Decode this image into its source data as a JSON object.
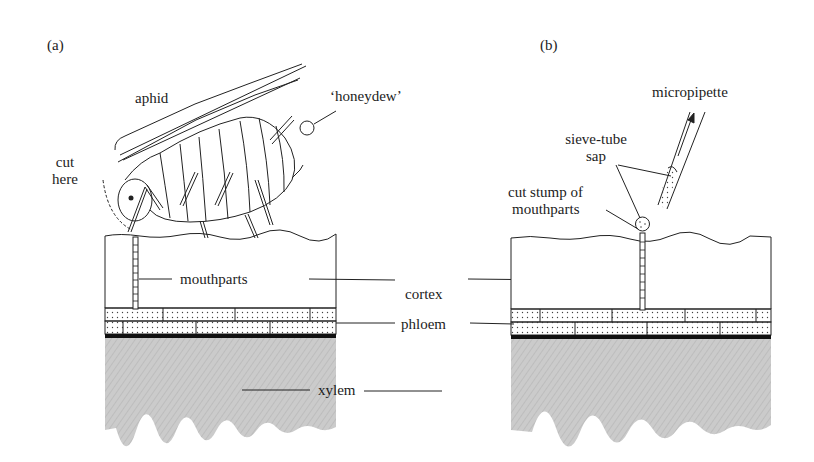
{
  "figure": {
    "panel_a": {
      "label": "(a)",
      "annotations": {
        "aphid": "aphid",
        "honeydew": "‘honeydew’",
        "cut_here_line1": "cut",
        "cut_here_line2": "here",
        "mouthparts": "mouthparts"
      }
    },
    "panel_b": {
      "label": "(b)",
      "annotations": {
        "micropipette": "micropipette",
        "sieve_tube_line1": "sieve-tube",
        "sieve_tube_line2": "sap",
        "cut_stump_line1": "cut stump of",
        "cut_stump_line2": "mouthparts"
      }
    },
    "shared_labels": {
      "cortex": "cortex",
      "phloem": "phloem",
      "xylem": "xylem"
    },
    "colors": {
      "ink": "#1c1c1c",
      "xylem_fill": "#c9c9c9",
      "background": "#ffffff"
    }
  }
}
